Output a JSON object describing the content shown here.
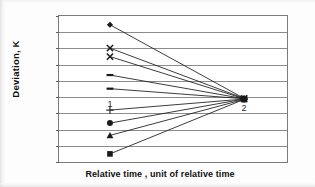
{
  "chart_data": {
    "type": "line",
    "title": "",
    "subtitle": "",
    "xlabel": "Relative time , unit of relative time",
    "ylabel": "Deviation, K",
    "categories": [
      "1",
      "2"
    ],
    "x": [
      1,
      2
    ],
    "xlim": [
      0.62,
      2.32
    ],
    "ylim": [
      -20,
      25
    ],
    "ytick_labels": [
      "25",
      "20",
      "15",
      "10",
      "5",
      "0",
      "-5",
      "-10",
      "-15",
      "-20"
    ],
    "ytick_values": [
      25,
      20,
      15,
      10,
      5,
      0,
      -5,
      -10,
      -15,
      -20
    ],
    "ytick_step": 5,
    "grid": "horizontal",
    "legend": "none",
    "legend_position": "none",
    "series": [
      {
        "name": "Series 1",
        "marker": "diamond",
        "values": [
          22.3,
          -0.4
        ]
      },
      {
        "name": "Series 2",
        "marker": "cross-x",
        "values": [
          15.1,
          -0.4
        ]
      },
      {
        "name": "Series 3",
        "marker": "cross-x",
        "values": [
          12.5,
          -0.5
        ]
      },
      {
        "name": "Series 4",
        "marker": "dash",
        "values": [
          6.8,
          -0.5
        ]
      },
      {
        "name": "Series 5",
        "marker": "dash",
        "values": [
          2.6,
          -0.5
        ]
      },
      {
        "name": "Series 6",
        "marker": "plus",
        "values": [
          -4.0,
          -0.6
        ]
      },
      {
        "name": "Series 7",
        "marker": "circle",
        "values": [
          -8.0,
          -0.6
        ]
      },
      {
        "name": "Series 8",
        "marker": "triangle",
        "values": [
          -11.8,
          -0.7
        ]
      },
      {
        "name": "Series 9",
        "marker": "square",
        "values": [
          -17.5,
          -0.7
        ]
      }
    ],
    "annotations": [
      {
        "text": "1",
        "x": 1,
        "y": -2.0
      },
      {
        "text": "2",
        "x": 2,
        "y": -3.4
      }
    ],
    "colors": {
      "line": "#1a1a1a",
      "marker": "#1a1a1a",
      "grid": "#8c8c8c",
      "frame": "#7a7a7a",
      "text": "#101010",
      "background": "#ffffff"
    }
  }
}
